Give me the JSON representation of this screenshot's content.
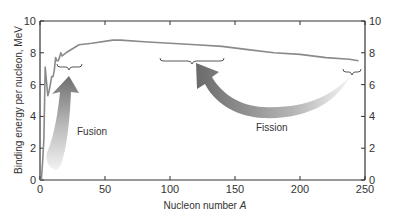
{
  "chart_data": {
    "type": "line",
    "title": "",
    "xlabel": "Nucleon number A",
    "ylabel": "Binding energy per nucleon, MeV",
    "xlim": [
      0,
      250
    ],
    "ylim": [
      0,
      10
    ],
    "xticks": [
      0,
      50,
      100,
      150,
      200,
      250
    ],
    "yticks": [
      0,
      2,
      4,
      6,
      8,
      10
    ],
    "right_yticks": [
      0,
      2,
      4,
      6,
      8,
      10
    ],
    "grid": false,
    "legend": null,
    "series": [
      {
        "name": "Binding energy per nucleon",
        "color": "#8a8a8a",
        "x": [
          1,
          2,
          3,
          4,
          6,
          7,
          9,
          10,
          11,
          12,
          13,
          14,
          15,
          16,
          17,
          20,
          30,
          40,
          56,
          62,
          80,
          100,
          120,
          140,
          160,
          180,
          200,
          220,
          238,
          245
        ],
        "y": [
          0.0,
          1.1,
          2.6,
          7.1,
          5.3,
          5.6,
          6.5,
          6.5,
          6.9,
          7.7,
          7.5,
          7.5,
          7.7,
          8.0,
          7.8,
          8.0,
          8.5,
          8.6,
          8.8,
          8.8,
          8.7,
          8.6,
          8.5,
          8.4,
          8.2,
          8.0,
          7.9,
          7.7,
          7.6,
          7.5
        ]
      }
    ],
    "annotations": [
      {
        "text": "Fusion",
        "type": "arrow",
        "direction": "up",
        "from": [
          10,
          0.5
        ],
        "to": [
          20,
          6.4
        ],
        "bracket_range": [
          9,
          30
        ],
        "bracket_y": 7.0
      },
      {
        "text": "Fission",
        "type": "arrow",
        "direction": "curved-left",
        "from": [
          240,
          6.8
        ],
        "to": [
          115,
          6.6
        ],
        "bracket_range": [
          95,
          145
        ],
        "bracket_y": 7.6
      },
      {
        "text": "",
        "type": "bracket",
        "bracket_range": [
          238,
          250
        ],
        "bracket_y": 7.1
      }
    ]
  },
  "labels": {
    "xlabel_text": "Nucleon number ",
    "xlabel_var": "A",
    "ylabel": "Binding energy per nucleon, MeV",
    "fusion": "Fusion",
    "fission": "Fission",
    "xticks": [
      "0",
      "50",
      "100",
      "150",
      "200",
      "250"
    ],
    "yticks": [
      "0",
      "2",
      "4",
      "6",
      "8",
      "10"
    ]
  }
}
